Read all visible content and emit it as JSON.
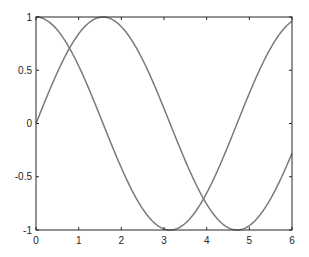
{
  "chart_data": {
    "type": "line",
    "title": "",
    "xlabel": "",
    "ylabel": "",
    "xlim": [
      0,
      6
    ],
    "ylim": [
      -1,
      1
    ],
    "grid": false,
    "legend": null,
    "xticks": [
      "0",
      "1",
      "2",
      "3",
      "4",
      "5",
      "6"
    ],
    "yticks": [
      "1",
      "0.5",
      "0",
      "-0.5",
      "-1"
    ],
    "series": [
      {
        "name": "sin(x)",
        "function": "sin",
        "x_range": [
          0,
          6
        ],
        "color": "#7a7a7a"
      },
      {
        "name": "cos(x)",
        "function": "cos",
        "x_range": [
          0,
          6
        ],
        "color": "#7a7a7a"
      }
    ]
  },
  "style": {
    "axis_color": "#262626",
    "line_color": "#7a7a7a"
  }
}
